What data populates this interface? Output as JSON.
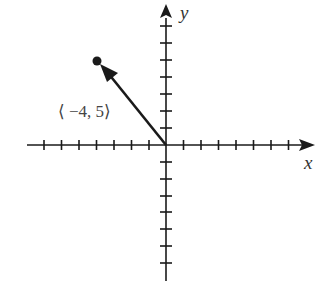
{
  "axes": {
    "x_label": "x",
    "y_label": "y",
    "ticks_each_side": 7
  },
  "vector": {
    "label": "⟨ −4, 5⟩",
    "x": -4,
    "y": 5
  },
  "colors": {
    "ink": "#1a1a1a"
  }
}
